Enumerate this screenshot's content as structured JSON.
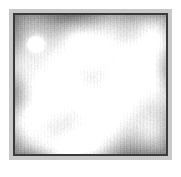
{
  "figure": {
    "kind": "scanning-probe-micrograph",
    "background_color": "#ffffff",
    "mount_color": "#c9c9c9",
    "border_color": "#3a3a3a",
    "scan": {
      "base_gray": "#9e9e9e",
      "highlight_color": "#f2f2f2",
      "shadow_color": "#6e6e6e",
      "defect_color": "#ffffff",
      "width_px": 151,
      "height_px": 139
    }
  },
  "chart_data": {
    "type": "heatmap",
    "title": "",
    "subtitle": "",
    "xlabel": "",
    "ylabel": "",
    "legend": [],
    "grid": false,
    "colormap": "grayscale",
    "value_range": [
      0,
      1
    ],
    "lattice": {
      "symmetry": "oblique-hexagonal",
      "period_x": 34,
      "period_y": 38,
      "row_offset_x": 17,
      "rotation_deg": -12,
      "maxima_across": 5,
      "maxima_down": 4
    },
    "maxima": [
      {
        "x": 0.14,
        "y": 0.2,
        "intensity": 0.78
      },
      {
        "x": 0.4,
        "y": 0.16,
        "intensity": 0.82
      },
      {
        "x": 0.64,
        "y": 0.13,
        "intensity": 0.8
      },
      {
        "x": 0.88,
        "y": 0.1,
        "intensity": 0.76
      },
      {
        "x": 0.03,
        "y": 0.38,
        "intensity": 0.74
      },
      {
        "x": 0.27,
        "y": 0.35,
        "intensity": 0.86
      },
      {
        "x": 0.52,
        "y": 0.31,
        "intensity": 0.84
      },
      {
        "x": 0.76,
        "y": 0.28,
        "intensity": 0.81
      },
      {
        "x": 0.98,
        "y": 0.25,
        "intensity": 0.72
      },
      {
        "x": 0.15,
        "y": 0.55,
        "intensity": 0.8
      },
      {
        "x": 0.4,
        "y": 0.52,
        "intensity": 0.88
      },
      {
        "x": 0.64,
        "y": 0.48,
        "intensity": 0.85
      },
      {
        "x": 0.88,
        "y": 0.45,
        "intensity": 0.79
      },
      {
        "x": 0.03,
        "y": 0.73,
        "intensity": 0.76
      },
      {
        "x": 0.28,
        "y": 0.7,
        "intensity": 0.83
      },
      {
        "x": 0.52,
        "y": 0.66,
        "intensity": 0.86
      },
      {
        "x": 0.76,
        "y": 0.63,
        "intensity": 0.82
      },
      {
        "x": 0.98,
        "y": 0.6,
        "intensity": 0.74
      },
      {
        "x": 0.16,
        "y": 0.9,
        "intensity": 0.77
      },
      {
        "x": 0.41,
        "y": 0.87,
        "intensity": 0.8
      },
      {
        "x": 0.65,
        "y": 0.84,
        "intensity": 0.78
      },
      {
        "x": 0.89,
        "y": 0.81,
        "intensity": 0.75
      },
      {
        "x": 0.3,
        "y": 1.02,
        "intensity": 0.72
      },
      {
        "x": 0.55,
        "y": 0.99,
        "intensity": 0.7
      }
    ],
    "defects": [
      {
        "name": "bright-defect-upper",
        "x": 0.135,
        "y": 0.205,
        "radius": 0.048,
        "intensity": 1.0
      },
      {
        "name": "bright-defect-lower",
        "x": 0.145,
        "y": 0.705,
        "radius": 0.052,
        "intensity": 1.0
      }
    ],
    "annotations": []
  }
}
